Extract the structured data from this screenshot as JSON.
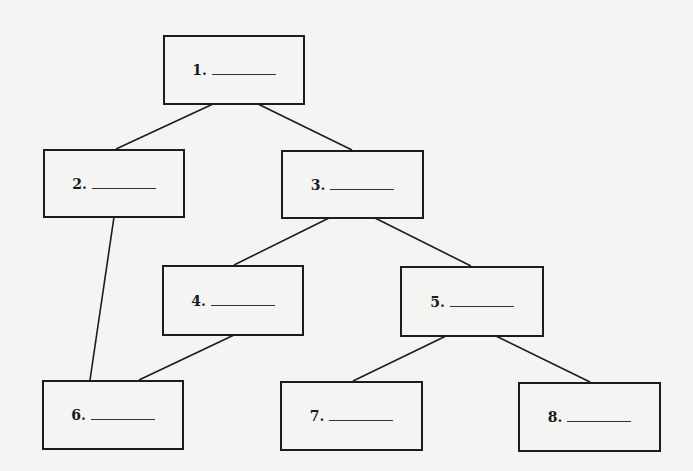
{
  "diagram": {
    "type": "tree",
    "background": "#f4f4f3",
    "stroke_color": "#1c1c1c",
    "nodes": [
      {
        "id": "1",
        "label": "1.",
        "blank": "________",
        "x": 163,
        "y": 35,
        "w": 142,
        "h": 70
      },
      {
        "id": "2",
        "label": "2.",
        "blank": "________",
        "x": 43,
        "y": 149,
        "w": 142,
        "h": 69
      },
      {
        "id": "3",
        "label": "3.",
        "blank": "________",
        "x": 281,
        "y": 150,
        "w": 143,
        "h": 69
      },
      {
        "id": "4",
        "label": "4.",
        "blank": "________",
        "x": 162,
        "y": 265,
        "w": 142,
        "h": 71
      },
      {
        "id": "5",
        "label": "5.",
        "blank": "________",
        "x": 400,
        "y": 266,
        "w": 144,
        "h": 71
      },
      {
        "id": "6",
        "label": "6.",
        "blank": "________",
        "x": 42,
        "y": 380,
        "w": 142,
        "h": 70
      },
      {
        "id": "7",
        "label": "7.",
        "blank": "________",
        "x": 280,
        "y": 381,
        "w": 143,
        "h": 70
      },
      {
        "id": "8",
        "label": "8.",
        "blank": "________",
        "x": 518,
        "y": 382,
        "w": 143,
        "h": 70
      }
    ],
    "edges": [
      {
        "from": "1",
        "to": "2",
        "x1": 213,
        "y1": 104,
        "x2": 116,
        "y2": 149
      },
      {
        "from": "1",
        "to": "3",
        "x1": 258,
        "y1": 104,
        "x2": 352,
        "y2": 150
      },
      {
        "from": "2",
        "to": "6",
        "x1": 114,
        "y1": 217,
        "x2": 90,
        "y2": 380
      },
      {
        "from": "3",
        "to": "4",
        "x1": 329,
        "y1": 218,
        "x2": 234,
        "y2": 265
      },
      {
        "from": "3",
        "to": "5",
        "x1": 375,
        "y1": 218,
        "x2": 471,
        "y2": 266
      },
      {
        "from": "4",
        "to": "6",
        "x1": 234,
        "y1": 335,
        "x2": 139,
        "y2": 380
      },
      {
        "from": "5",
        "to": "7",
        "x1": 446,
        "y1": 336,
        "x2": 353,
        "y2": 381
      },
      {
        "from": "5",
        "to": "8",
        "x1": 496,
        "y1": 336,
        "x2": 590,
        "y2": 382
      }
    ]
  }
}
